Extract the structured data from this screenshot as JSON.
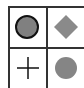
{
  "grid": {
    "cells": [
      {
        "shape": "circle-outlined-icon",
        "fill": "#808080",
        "stroke": "#111111"
      },
      {
        "shape": "diamond-icon",
        "fill": "#8a8a8a"
      },
      {
        "shape": "plus-icon",
        "stroke": "#111111"
      },
      {
        "shape": "circle-icon",
        "fill": "#858585"
      }
    ]
  }
}
